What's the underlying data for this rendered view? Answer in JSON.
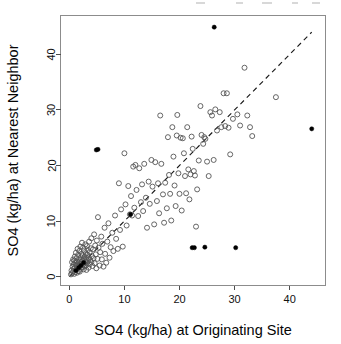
{
  "figure": {
    "width": 341,
    "height": 344,
    "background": "#ffffff",
    "frame_color": "#8c8c8c",
    "point_open_color": "#555555",
    "point_solid_color": "#000000",
    "reference_line_color": "#1a1a1a"
  },
  "chart_data": {
    "type": "scatter",
    "title": "",
    "subtitle": "",
    "xlabel": "SO4 (kg/ha) at Originating Site",
    "ylabel": "SO4 (kg/ha) at Nearest Neighbor",
    "xlim": [
      -1.6,
      46.5
    ],
    "ylim": [
      -1.6,
      47.0
    ],
    "xticks": [
      0,
      10,
      20,
      30,
      40
    ],
    "xticklabels": [
      "0",
      "10",
      "20",
      "30",
      "40"
    ],
    "yticks": [
      0,
      10,
      20,
      30,
      40
    ],
    "yticklabels": [
      "0",
      "10",
      "20",
      "30",
      "40"
    ],
    "grid": false,
    "legend": null,
    "annotations": [],
    "reference_line": {
      "name": "one-to-one-line",
      "style": "dashed",
      "slope": 1,
      "intercept": 0,
      "x_start": 0.0,
      "x_end": 44.0,
      "y_start": 0.0,
      "y_end": 44.0
    },
    "series": [
      {
        "name": "Site pairs",
        "marker": "open-circle",
        "color": "#555555",
        "points": [
          [
            0.3,
            0.4
          ],
          [
            0.4,
            1.1
          ],
          [
            0.5,
            0.6
          ],
          [
            0.5,
            2.6
          ],
          [
            0.6,
            1.8
          ],
          [
            0.7,
            0.9
          ],
          [
            0.7,
            3.1
          ],
          [
            0.8,
            1.4
          ],
          [
            0.8,
            2.2
          ],
          [
            0.9,
            0.5
          ],
          [
            0.9,
            2.9
          ],
          [
            1.0,
            1.7
          ],
          [
            1.0,
            3.6
          ],
          [
            1.1,
            0.8
          ],
          [
            1.1,
            2.4
          ],
          [
            1.2,
            1.2
          ],
          [
            1.2,
            4.3
          ],
          [
            1.3,
            2.0
          ],
          [
            1.3,
            3.3
          ],
          [
            1.4,
            0.7
          ],
          [
            1.4,
            2.7
          ],
          [
            1.5,
            1.5
          ],
          [
            1.5,
            5.0
          ],
          [
            1.6,
            2.2
          ],
          [
            1.6,
            3.9
          ],
          [
            1.7,
            1.0
          ],
          [
            1.7,
            2.5
          ],
          [
            1.8,
            1.9
          ],
          [
            1.8,
            4.6
          ],
          [
            1.9,
            0.9
          ],
          [
            1.9,
            3.0
          ],
          [
            2.0,
            2.3
          ],
          [
            2.0,
            5.4
          ],
          [
            2.1,
            1.4
          ],
          [
            2.1,
            3.5
          ],
          [
            2.2,
            2.6
          ],
          [
            2.2,
            4.1
          ],
          [
            2.3,
            1.7
          ],
          [
            2.3,
            6.1
          ],
          [
            2.4,
            2.9
          ],
          [
            2.4,
            3.8
          ],
          [
            2.5,
            2.1
          ],
          [
            2.5,
            5.2
          ],
          [
            2.6,
            1.3
          ],
          [
            2.6,
            3.2
          ],
          [
            2.7,
            2.4
          ],
          [
            2.7,
            4.7
          ],
          [
            2.8,
            1.8
          ],
          [
            2.8,
            3.6
          ],
          [
            2.9,
            2.7
          ],
          [
            2.9,
            5.8
          ],
          [
            3.0,
            2.0
          ],
          [
            3.0,
            4.2
          ],
          [
            3.1,
            3.1
          ],
          [
            3.1,
            1.2
          ],
          [
            3.2,
            2.5
          ],
          [
            3.2,
            5.5
          ],
          [
            3.3,
            3.9
          ],
          [
            3.4,
            2.8
          ],
          [
            3.4,
            4.8
          ],
          [
            3.5,
            1.6
          ],
          [
            3.5,
            3.4
          ],
          [
            3.6,
            6.3
          ],
          [
            3.7,
            2.2
          ],
          [
            3.7,
            4.4
          ],
          [
            3.8,
            3.0
          ],
          [
            3.9,
            5.1
          ],
          [
            4.0,
            2.6
          ],
          [
            4.0,
            6.9
          ],
          [
            4.1,
            3.7
          ],
          [
            4.2,
            1.9
          ],
          [
            4.3,
            4.9
          ],
          [
            4.4,
            3.3
          ],
          [
            4.5,
            7.6
          ],
          [
            4.6,
            2.4
          ],
          [
            4.7,
            5.6
          ],
          [
            4.8,
            4.0
          ],
          [
            4.9,
            1.5
          ],
          [
            5.0,
            6.5
          ],
          [
            5.1,
            3.2
          ],
          [
            5.2,
            10.7
          ],
          [
            5.3,
            5.2
          ],
          [
            5.5,
            2.0
          ],
          [
            5.6,
            4.4
          ],
          [
            5.8,
            7.2
          ],
          [
            5.9,
            3.1
          ],
          [
            6.0,
            5.9
          ],
          [
            6.2,
            1.8
          ],
          [
            6.4,
            8.8
          ],
          [
            6.5,
            4.1
          ],
          [
            6.7,
            2.5
          ],
          [
            6.9,
            6.3
          ],
          [
            7.1,
            9.6
          ],
          [
            7.3,
            3.4
          ],
          [
            7.5,
            5.3
          ],
          [
            7.8,
            7.9
          ],
          [
            8.0,
            4.6
          ],
          [
            8.3,
            11.0
          ],
          [
            8.5,
            6.8
          ],
          [
            8.8,
            5.0
          ],
          [
            9.0,
            16.8
          ],
          [
            9.2,
            8.4
          ],
          [
            9.4,
            12.1
          ],
          [
            9.7,
            5.4
          ],
          [
            10.0,
            22.2
          ],
          [
            10.2,
            13.0
          ],
          [
            10.4,
            9.2
          ],
          [
            10.7,
            16.3
          ],
          [
            11.0,
            11.2
          ],
          [
            11.2,
            14.5
          ],
          [
            11.4,
            11.0
          ],
          [
            11.6,
            19.8
          ],
          [
            11.8,
            12.4
          ],
          [
            12.0,
            20.1
          ],
          [
            12.2,
            15.6
          ],
          [
            12.5,
            10.9
          ],
          [
            12.7,
            19.5
          ],
          [
            13.0,
            13.4
          ],
          [
            13.2,
            16.6
          ],
          [
            13.4,
            11.8
          ],
          [
            13.6,
            20.3
          ],
          [
            13.9,
            14.2
          ],
          [
            14.1,
            8.8
          ],
          [
            14.4,
            17.1
          ],
          [
            14.6,
            13.1
          ],
          [
            14.9,
            21.0
          ],
          [
            15.1,
            16.2
          ],
          [
            15.4,
            9.4
          ],
          [
            15.6,
            20.6
          ],
          [
            15.9,
            13.6
          ],
          [
            16.1,
            16.8
          ],
          [
            16.3,
            11.4
          ],
          [
            16.5,
            29.0
          ],
          [
            16.7,
            20.3
          ],
          [
            17.0,
            14.8
          ],
          [
            17.2,
            9.7
          ],
          [
            17.4,
            16.9
          ],
          [
            17.7,
            12.3
          ],
          [
            17.9,
            25.1
          ],
          [
            18.1,
            18.3
          ],
          [
            18.3,
            14.9
          ],
          [
            18.5,
            10.1
          ],
          [
            18.7,
            26.9
          ],
          [
            18.9,
            21.6
          ],
          [
            19.1,
            16.4
          ],
          [
            19.3,
            12.7
          ],
          [
            19.5,
            25.4
          ],
          [
            19.6,
            29.1
          ],
          [
            19.8,
            18.6
          ],
          [
            20.0,
            14.9
          ],
          [
            20.2,
            25.0
          ],
          [
            20.4,
            11.9
          ],
          [
            20.6,
            24.9
          ],
          [
            20.8,
            22.2
          ],
          [
            21.0,
            18.1
          ],
          [
            21.2,
            15.0
          ],
          [
            21.4,
            26.9
          ],
          [
            21.6,
            19.3
          ],
          [
            21.8,
            13.9
          ],
          [
            22.0,
            18.4
          ],
          [
            22.2,
            25.2
          ],
          [
            22.4,
            23.0
          ],
          [
            22.6,
            19.0
          ],
          [
            22.8,
            18.2
          ],
          [
            23.0,
            9.0
          ],
          [
            23.2,
            15.7
          ],
          [
            23.5,
            20.9
          ],
          [
            23.8,
            30.7
          ],
          [
            24.0,
            25.5
          ],
          [
            24.3,
            23.9
          ],
          [
            24.5,
            25.1
          ],
          [
            24.7,
            24.8
          ],
          [
            25.0,
            20.7
          ],
          [
            25.3,
            18.1
          ],
          [
            25.6,
            29.6
          ],
          [
            25.9,
            29.0
          ],
          [
            26.2,
            21.0
          ],
          [
            26.5,
            30.1
          ],
          [
            26.8,
            26.3
          ],
          [
            27.3,
            29.6
          ],
          [
            27.6,
            26.9
          ],
          [
            28.0,
            33.0
          ],
          [
            28.3,
            27.1
          ],
          [
            28.6,
            33.0
          ],
          [
            28.9,
            26.8
          ],
          [
            29.2,
            22.0
          ],
          [
            29.7,
            28.4
          ],
          [
            30.5,
            29.2
          ],
          [
            31.0,
            27.2
          ],
          [
            31.8,
            37.6
          ],
          [
            32.3,
            29.0
          ],
          [
            32.8,
            26.9
          ],
          [
            33.2,
            25.3
          ],
          [
            37.5,
            32.3
          ]
        ]
      },
      {
        "name": "Flagged pairs",
        "marker": "filled-circle",
        "color": "#000000",
        "points": [
          [
            4.9,
            22.8
          ],
          [
            5.2,
            22.9
          ],
          [
            22.3,
            5.2
          ],
          [
            22.7,
            5.2
          ],
          [
            24.6,
            5.3
          ],
          [
            30.2,
            5.2
          ],
          [
            26.3,
            44.9
          ],
          [
            44.0,
            26.6
          ],
          [
            11.1,
            11.2
          ],
          [
            2.1,
            2.0
          ],
          [
            1.7,
            1.6
          ],
          [
            2.6,
            2.5
          ],
          [
            1.2,
            1.1
          ]
        ]
      }
    ]
  }
}
